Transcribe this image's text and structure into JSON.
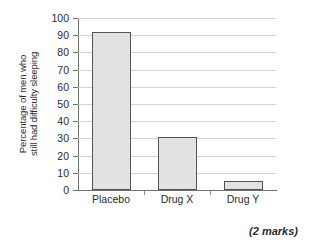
{
  "chart_data": {
    "type": "bar",
    "title": "",
    "xlabel": "",
    "ylabel": "Percentage of men who still had difficulty sleeping",
    "ylabel_lines": [
      "Percentage of men who",
      "still had difficulty sleeping"
    ],
    "categories": [
      "Placebo",
      "Drug X",
      "Drug Y"
    ],
    "values": [
      92,
      31,
      5.5
    ],
    "ylim": [
      0,
      100
    ],
    "ytick_step": 10,
    "yticks": [
      0,
      10,
      20,
      30,
      40,
      50,
      60,
      70,
      80,
      90,
      100
    ],
    "ytick_labels": [
      "0",
      "10",
      "20",
      "30",
      "40",
      "50",
      "60",
      "70",
      "80",
      "90",
      "100"
    ],
    "grid": true,
    "grid_axis": "y",
    "legend": false,
    "legend_position": "none",
    "bar_fill_color": "#e2e2e2",
    "bar_edge_color": "#545454",
    "gridline_color": "#d2d2d2",
    "axis_color": "#6f6f6f",
    "background_color": "#ffffff",
    "text_color": "#2b2b2b",
    "bars": [
      {
        "category": "Placebo",
        "value": 92
      },
      {
        "category": "Drug X",
        "value": 31
      },
      {
        "category": "Drug Y",
        "value": 5.5
      }
    ]
  },
  "footer": {
    "marks_note": "(2 marks)"
  }
}
